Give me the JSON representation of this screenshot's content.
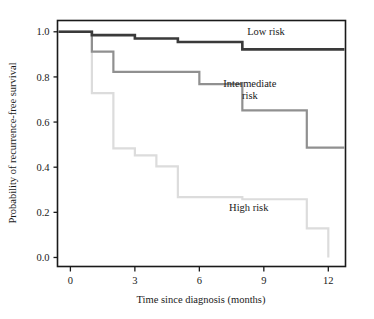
{
  "chart_data": {
    "type": "line",
    "subtype": "kaplan-meier-step",
    "title": "",
    "xlabel": "Time since diagnosis (months)",
    "ylabel": "Probability of recurrence-free survival",
    "xlim": [
      -0.6,
      12.8
    ],
    "ylim": [
      -0.04,
      1.05
    ],
    "xticks": [
      0,
      3,
      6,
      9,
      12
    ],
    "xtick_labels": [
      "0",
      "3",
      "6",
      "9",
      "12"
    ],
    "yticks": [
      0.0,
      0.2,
      0.4,
      0.6,
      0.8,
      1.0
    ],
    "ytick_labels": [
      "0.0",
      "0.2",
      "0.4",
      "0.6",
      "0.8",
      "1.0"
    ],
    "grid": false,
    "legend_position": "inline-annotations",
    "series": [
      {
        "name": "Low risk",
        "color": "#3a3a3a",
        "line_width": 2.6,
        "label_x": 9.1,
        "label_y": 0.985,
        "x": [
          -0.55,
          1.0,
          1.0,
          3.0,
          3.0,
          5.0,
          5.0,
          8.0,
          8.0,
          12.75
        ],
        "y": [
          1.0,
          1.0,
          0.985,
          0.985,
          0.97,
          0.97,
          0.955,
          0.955,
          0.922,
          0.922
        ],
        "steps": [
          {
            "time": 0,
            "survival": 1.0
          },
          {
            "time": 1,
            "survival": 0.985
          },
          {
            "time": 3,
            "survival": 0.97
          },
          {
            "time": 5,
            "survival": 0.955
          },
          {
            "time": 8,
            "survival": 0.922
          },
          {
            "time": 12.75,
            "survival": 0.922
          }
        ]
      },
      {
        "name": "Intermediate risk",
        "color": "#909090",
        "line_width": 2.2,
        "label_x": 8.35,
        "label_y": 0.755,
        "x": [
          -0.55,
          1.0,
          1.0,
          2.0,
          2.0,
          6.0,
          6.0,
          8.0,
          8.0,
          11.0,
          11.0,
          12.75
        ],
        "y": [
          1.0,
          1.0,
          0.912,
          0.912,
          0.822,
          0.822,
          0.768,
          0.768,
          0.652,
          0.652,
          0.487,
          0.487
        ],
        "steps": [
          {
            "time": 0,
            "survival": 1.0
          },
          {
            "time": 1,
            "survival": 0.912
          },
          {
            "time": 2,
            "survival": 0.822
          },
          {
            "time": 6,
            "survival": 0.768
          },
          {
            "time": 8,
            "survival": 0.652
          },
          {
            "time": 11,
            "survival": 0.487
          },
          {
            "time": 12.75,
            "survival": 0.487
          }
        ]
      },
      {
        "name": "High risk",
        "color": "#dcdcdc",
        "line_width": 2.2,
        "label_x": 8.3,
        "label_y": 0.205,
        "x": [
          -0.55,
          1.0,
          1.0,
          2.0,
          2.0,
          3.0,
          3.0,
          4.0,
          4.0,
          5.0,
          5.0,
          8.0,
          8.0,
          11.0,
          11.0,
          12.0,
          12.0
        ],
        "y": [
          1.0,
          1.0,
          0.728,
          0.728,
          0.483,
          0.483,
          0.452,
          0.452,
          0.404,
          0.404,
          0.267,
          0.267,
          0.258,
          0.258,
          0.129,
          0.129,
          0.0
        ],
        "steps": [
          {
            "time": 0,
            "survival": 1.0
          },
          {
            "time": 1,
            "survival": 0.728
          },
          {
            "time": 2,
            "survival": 0.483
          },
          {
            "time": 3,
            "survival": 0.452
          },
          {
            "time": 4,
            "survival": 0.404
          },
          {
            "time": 5,
            "survival": 0.267
          },
          {
            "time": 8,
            "survival": 0.258
          },
          {
            "time": 11,
            "survival": 0.129
          },
          {
            "time": 12,
            "survival": 0.0
          }
        ]
      }
    ],
    "annotations": [
      {
        "text": "Low risk",
        "series": "Low risk"
      },
      {
        "text": "Intermediate",
        "series": "Intermediate risk",
        "line": 1
      },
      {
        "text": "risk",
        "series": "Intermediate risk",
        "line": 2
      },
      {
        "text": "High risk",
        "series": "High risk"
      }
    ]
  },
  "axes": {
    "x_title": "Time since diagnosis (months)",
    "y_title": "Probability of recurrence-free survival"
  },
  "labels": {
    "low_risk": "Low risk",
    "intermediate_risk_line1": "Intermediate",
    "intermediate_risk_line2": "risk",
    "high_risk": "High risk"
  },
  "colors": {
    "low_risk": "#3a3a3a",
    "intermediate_risk": "#909090",
    "high_risk": "#dcdcdc",
    "axis": "#1a1a1a",
    "background": "#ffffff"
  }
}
